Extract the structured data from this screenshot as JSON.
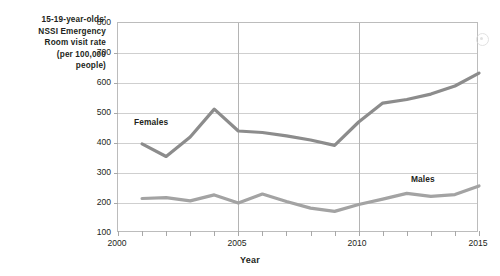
{
  "chart_data": {
    "type": "line",
    "title": "",
    "ylabel": "15-19-year-olds' NSSI Emergency Room visit rate (per 100,000 people)",
    "ylabel_lines": [
      "15-19-year-olds'",
      "NSSI Emergency",
      "Room visit rate",
      "(per 100,000",
      "people)"
    ],
    "xlabel": "Year",
    "xlim": [
      2000,
      2015
    ],
    "ylim": [
      100,
      800
    ],
    "yticks": [
      800,
      700,
      600,
      500,
      400,
      300,
      200,
      100
    ],
    "ytick_labels": [
      "800",
      "700",
      "600",
      "500",
      "400",
      "300",
      "200",
      "100"
    ],
    "xticks": [
      2000,
      2005,
      2010,
      2015
    ],
    "xtick_labels": [
      "2000",
      "2005",
      "2010",
      "2015"
    ],
    "x_minor_ticks": [
      2000,
      2001,
      2002,
      2003,
      2004,
      2005,
      2006,
      2007,
      2008,
      2009,
      2010,
      2011,
      2012,
      2013,
      2014,
      2015
    ],
    "grid": true,
    "grid_horizontal": true,
    "grid_vertical_at": [
      2005,
      2010
    ],
    "legend_position": "inline-labels",
    "x": [
      2001,
      2002,
      2003,
      2004,
      2005,
      2006,
      2007,
      2008,
      2009,
      2010,
      2011,
      2012,
      2013,
      2014,
      2015
    ],
    "series": [
      {
        "name": "Females",
        "color": "#8c8c8c",
        "values": [
          397,
          355,
          420,
          513,
          440,
          435,
          424,
          410,
          392,
          470,
          533,
          545,
          563,
          590,
          633
        ]
      },
      {
        "name": "Males",
        "color": "#a3a3a3",
        "values": [
          215,
          218,
          207,
          227,
          200,
          230,
          205,
          183,
          172,
          195,
          213,
          232,
          222,
          228,
          257
        ]
      }
    ],
    "annotations": [
      {
        "text": "Females",
        "x": 2002.2,
        "y": 470
      },
      {
        "text": "Males",
        "x": 2013.0,
        "y": 285
      }
    ]
  },
  "axis": {
    "y_title_lines": [
      "15-19-year-olds'",
      "NSSI Emergency",
      "Room visit rate",
      "(per 100,000",
      "people)"
    ],
    "x_title": "Year",
    "y_tick_labels": [
      "800",
      "700",
      "600",
      "500",
      "400",
      "300",
      "200",
      "100"
    ],
    "x_tick_labels": [
      "2000",
      "2005",
      "2010",
      "2015"
    ]
  },
  "series_labels": {
    "females": "Females",
    "males": "Males"
  },
  "colors": {
    "females_line": "#8c8c8c",
    "males_line": "#a3a3a3",
    "gridline": "#cfcfcf",
    "frame": "#bcbcbc",
    "text": "#231f20",
    "background": "#ffffff"
  }
}
